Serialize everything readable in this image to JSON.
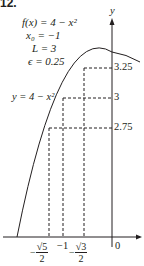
{
  "problem_number": "12.",
  "given": {
    "function": "f(x) = 4 − x²",
    "x0": "x₀ = −1",
    "L": "L = 3",
    "epsilon": "ϵ = 0.25"
  },
  "curve_label": "y = 4 − x²",
  "axes": {
    "y_label": "y",
    "origin_label": "0"
  },
  "y_ticks": [
    "3.25",
    "3",
    "2.75"
  ],
  "x_ticks": [
    {
      "sign": "−",
      "num": "√5",
      "den": "2"
    },
    {
      "label": "−1"
    },
    {
      "sign": "−",
      "num": "√3",
      "den": "2"
    }
  ],
  "colors": {
    "ink": "#231f20",
    "curve": "#231f20",
    "background": "#ffffff"
  }
}
